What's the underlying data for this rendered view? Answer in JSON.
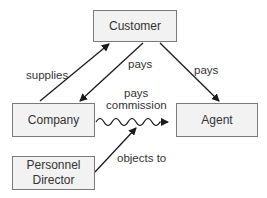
{
  "nodes": {
    "customer": {
      "label": "Customer"
    },
    "company": {
      "label": "Company"
    },
    "agent": {
      "label": "Agent"
    },
    "personnel_director": {
      "label_line1": "Personnel",
      "label_line2": "Director"
    }
  },
  "edges": {
    "supplies": {
      "label": "supplies",
      "from": "Company",
      "to": "Customer"
    },
    "pays_company": {
      "label": "pays",
      "from": "Customer",
      "to": "Company"
    },
    "pays_agent": {
      "label": "pays",
      "from": "Customer",
      "to": "Agent"
    },
    "pays_commission": {
      "label_line1": "pays",
      "label_line2": "commission",
      "from": "Company",
      "to": "Agent",
      "style": "wavy"
    },
    "objects_to": {
      "label": "objects to",
      "from": "Personnel Director",
      "to": "pays commission"
    }
  },
  "colors": {
    "box_fill": "#f2f2f2",
    "box_border": "#7a7a7a",
    "line": "#1a1a1a"
  }
}
